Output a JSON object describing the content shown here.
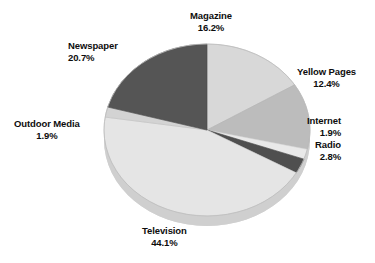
{
  "chart_data": {
    "type": "pie",
    "title": "",
    "subtitle": "",
    "xlabel": "",
    "ylabel": "",
    "legend_position": "none",
    "grid": false,
    "style": "3d-pie",
    "unit": "%",
    "categories": [
      "Magazine",
      "Yellow Pages",
      "Internet",
      "Radio",
      "Television",
      "Outdoor Media",
      "Newspaper"
    ],
    "values": [
      16.2,
      12.4,
      1.9,
      2.8,
      44.1,
      1.9,
      20.7
    ],
    "slices": [
      {
        "label": "Magazine",
        "value": 16.2,
        "value_text": "16.2%",
        "color": "#d8d8d8"
      },
      {
        "label": "Yellow Pages",
        "value": 12.4,
        "value_text": "12.4%",
        "color": "#bcbcbc"
      },
      {
        "label": "Internet",
        "value": 1.9,
        "value_text": "1.9%",
        "color": "#e9e9e9"
      },
      {
        "label": "Radio",
        "value": 2.8,
        "value_text": "2.8%",
        "color": "#4f4f4f"
      },
      {
        "label": "Television",
        "value": 44.1,
        "value_text": "44.1%",
        "color": "#e5e5e5"
      },
      {
        "label": "Outdoor Media",
        "value": 1.9,
        "value_text": "1.9%",
        "color": "#d3d3d3"
      },
      {
        "label": "Newspaper",
        "value": 20.7,
        "value_text": "20.7%",
        "color": "#555555"
      }
    ],
    "total": 100.0
  },
  "colors": {
    "background": "#ffffff",
    "text": "#0d0d0d",
    "slice_light": "#e5e5e5",
    "slice_mid": "#bcbcbc",
    "slice_dark": "#4f4f4f",
    "outline": "#a8a8a8"
  },
  "labels": {
    "magazine": {
      "name": "Magazine",
      "value": "16.2%"
    },
    "newspaper": {
      "name": "Newspaper",
      "value": "20.7%"
    },
    "yellow_pages": {
      "name": "Yellow Pages",
      "value": "12.4%"
    },
    "internet": {
      "name": "Internet",
      "value": "1.9%"
    },
    "radio": {
      "name": "Radio",
      "value": "2.8%"
    },
    "outdoor_media": {
      "name": "Outdoor Media",
      "value": "1.9%"
    },
    "television": {
      "name": "Television",
      "value": "44.1%"
    }
  }
}
